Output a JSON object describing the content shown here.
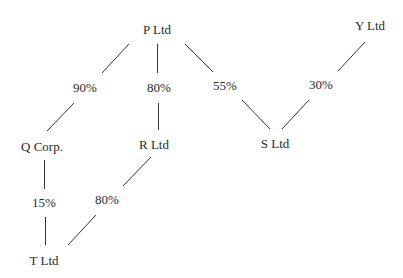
{
  "diagram": {
    "type": "ownership-structure",
    "entities": [
      {
        "id": "P",
        "label": "P Ltd",
        "x": 157,
        "y": 29
      },
      {
        "id": "Y",
        "label": "Y Ltd",
        "x": 370,
        "y": 25
      },
      {
        "id": "Q",
        "label": "Q Corp.",
        "x": 42,
        "y": 146
      },
      {
        "id": "R",
        "label": "R Ltd",
        "x": 154,
        "y": 144
      },
      {
        "id": "S",
        "label": "S Ltd",
        "x": 275,
        "y": 143
      },
      {
        "id": "T",
        "label": "T Ltd",
        "x": 44,
        "y": 260
      }
    ],
    "holdings": [
      {
        "from": "P",
        "to": "Q",
        "percent": "90%",
        "x": 85,
        "y": 87
      },
      {
        "from": "P",
        "to": "R",
        "percent": "80%",
        "x": 159,
        "y": 87
      },
      {
        "from": "P",
        "to": "S",
        "percent": "55%",
        "x": 225,
        "y": 85
      },
      {
        "from": "Y",
        "to": "S",
        "percent": "30%",
        "x": 321,
        "y": 84
      },
      {
        "from": "Q",
        "to": "T",
        "percent": "15%",
        "x": 44,
        "y": 202
      },
      {
        "from": "R",
        "to": "T",
        "percent": "80%",
        "x": 107,
        "y": 199
      }
    ],
    "line_color": "#333333"
  }
}
